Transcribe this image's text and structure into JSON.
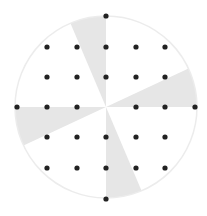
{
  "diagram": {
    "type": "dotted-circle-with-shaded-wedges",
    "circle": {
      "cx": 106,
      "cy": 107,
      "r": 91,
      "stroke": "#ececec",
      "fill": "#ffffff"
    },
    "wedges": [
      {
        "name": "top-wedge",
        "start_deg": -113,
        "end_deg": -90
      },
      {
        "name": "right-wedge",
        "start_deg": -25,
        "end_deg": 0
      },
      {
        "name": "bottom-wedge",
        "start_deg": 67,
        "end_deg": 90
      },
      {
        "name": "left-wedge",
        "start_deg": 155,
        "end_deg": 180
      }
    ],
    "wedge_color": "#e6e6e6",
    "dot_color": "#222222",
    "dot_radius": 2.6,
    "dots": [
      [
        106,
        16
      ],
      [
        47,
        47
      ],
      [
        77,
        47
      ],
      [
        106,
        47
      ],
      [
        136,
        47
      ],
      [
        165,
        47
      ],
      [
        47,
        77
      ],
      [
        77,
        77
      ],
      [
        106,
        77
      ],
      [
        136,
        77
      ],
      [
        165,
        77
      ],
      [
        17,
        107
      ],
      [
        47,
        107
      ],
      [
        77,
        107
      ],
      [
        136,
        107
      ],
      [
        165,
        107
      ],
      [
        195,
        107
      ],
      [
        47,
        137
      ],
      [
        77,
        137
      ],
      [
        106,
        137
      ],
      [
        136,
        137
      ],
      [
        165,
        137
      ],
      [
        47,
        168
      ],
      [
        77,
        168
      ],
      [
        106,
        168
      ],
      [
        136,
        168
      ],
      [
        165,
        168
      ],
      [
        106,
        199
      ]
    ]
  }
}
